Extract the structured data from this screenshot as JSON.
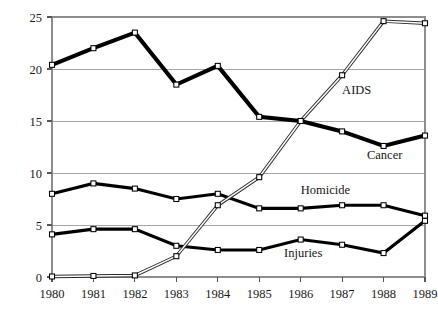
{
  "chart_data": {
    "type": "line",
    "title": "",
    "subtitle": "",
    "xlabel": "",
    "ylabel": "",
    "x": [
      1980,
      1981,
      1982,
      1983,
      1984,
      1985,
      1986,
      1987,
      1988,
      1989
    ],
    "xticklabels": [
      "1980",
      "1981",
      "1982",
      "1983",
      "1984",
      "1985",
      "1986",
      "1987",
      "1988",
      "1989"
    ],
    "yticklabels": [
      "0",
      "5",
      "10",
      "15",
      "20",
      "25"
    ],
    "yticks": [
      0,
      5,
      10,
      15,
      20,
      25
    ],
    "xlim": [
      1980,
      1989
    ],
    "ylim": [
      0,
      25
    ],
    "grid": "horizontal",
    "legend_position": "inline-annotations",
    "series": [
      {
        "name": "Cancer",
        "label": "Cancer",
        "style": "thick-black",
        "marker": "open-square",
        "values": [
          20.4,
          22.0,
          23.5,
          18.5,
          20.3,
          15.4,
          15.0,
          14.0,
          12.6,
          13.6
        ]
      },
      {
        "name": "AIDS",
        "label": "AIDS",
        "style": "thin-outlined",
        "marker": "open-square",
        "values": [
          0.05,
          0.1,
          0.15,
          2.0,
          6.9,
          9.6,
          15.0,
          19.4,
          24.6,
          24.4
        ]
      },
      {
        "name": "Homicide",
        "label": "Homicide",
        "style": "medium-black",
        "marker": "open-square",
        "values": [
          8.0,
          9.0,
          8.5,
          7.5,
          8.0,
          6.6,
          6.6,
          6.9,
          6.9,
          5.9
        ]
      },
      {
        "name": "Injuries",
        "label": "Injuries",
        "style": "medium-black",
        "marker": "open-square",
        "values": [
          4.1,
          4.6,
          4.6,
          3.0,
          2.6,
          2.6,
          3.6,
          3.1,
          2.3,
          5.4
        ]
      }
    ],
    "annotations": [
      {
        "text": "AIDS",
        "x": 1987.0,
        "y": 17.6,
        "anchor": "start"
      },
      {
        "text": "Cancer",
        "x": 1987.6,
        "y": 11.3,
        "anchor": "start"
      },
      {
        "text": "Homicide",
        "x": 1986.0,
        "y": 8.0,
        "anchor": "start"
      },
      {
        "text": "Injuries",
        "x": 1985.6,
        "y": 1.9,
        "anchor": "start"
      }
    ],
    "colors": {
      "line": "#000000",
      "marker_fill": "#ffffff",
      "grid": "#9b9b9b",
      "frame": "#8d8d8d",
      "text": "#1a1a1a"
    }
  }
}
